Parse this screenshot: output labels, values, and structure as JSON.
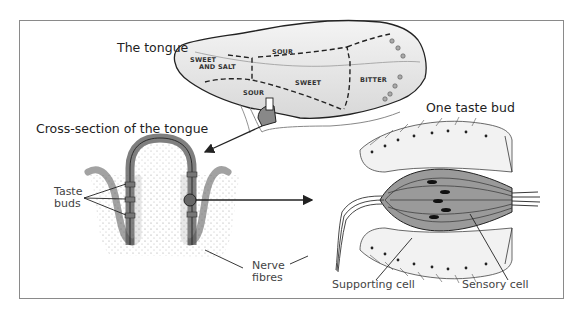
{
  "figure": {
    "title_tongue": "The tongue",
    "title_cross_section": "Cross-section of the tongue",
    "title_taste_bud": "One taste bud",
    "tongue_zones": {
      "sweet_and_salt_line1": "SWEET",
      "sweet_and_salt_line2": "AND SALT",
      "sour_top": "SOUR",
      "sweet": "SWEET",
      "sour_bottom": "SOUR",
      "bitter": "BITTER"
    },
    "labels": {
      "taste_buds_line1": "Taste",
      "taste_buds_line2": "buds",
      "nerve_fibres_line1": "Nerve",
      "nerve_fibres_line2": "fibres",
      "supporting_cell": "Supporting cell",
      "sensory_cell": "Sensory cell"
    }
  }
}
